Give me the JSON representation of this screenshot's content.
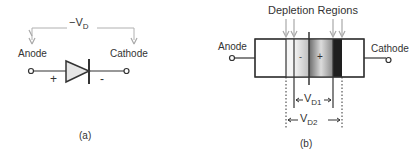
{
  "panel_a": {
    "voltage_label": "−V",
    "voltage_sub": "D",
    "anode_label": "Anode",
    "cathode_label": "Cathode",
    "plus_sign": "+",
    "minus_sign": "-",
    "caption": "(a)"
  },
  "panel_b": {
    "title": "Depletion Regions",
    "anode_label": "Anode",
    "cathode_label": "Cathode",
    "minus_sign": "-",
    "plus_sign": "+",
    "vd1_label": "V",
    "vd1_sub": "D1",
    "vd2_label": "V",
    "vd2_sub": "D2",
    "caption": "(b)"
  },
  "colors": {
    "line": "#333333",
    "arrow": "#a8a8a8",
    "triangle_fill": "#e6e6e6"
  }
}
